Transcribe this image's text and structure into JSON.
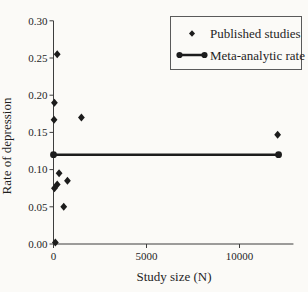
{
  "figure": {
    "background": "#fbfaf7",
    "ink": "#1c1c1c",
    "axis_color": "#3d3d3d"
  },
  "chart_data": {
    "type": "scatter",
    "title": "",
    "xlabel": "Study size (N)",
    "ylabel": "Rate of depression",
    "xlim": [
      0,
      12900
    ],
    "ylim": [
      0,
      0.3
    ],
    "x_ticks": [
      0,
      5000,
      10000
    ],
    "y_ticks": [
      0.0,
      0.05,
      0.1,
      0.15,
      0.2,
      0.25,
      0.3
    ],
    "y_tick_decimals": 2,
    "grid": false,
    "legend_position": "top-right",
    "series": [
      {
        "name": "Published studies",
        "type": "scatter",
        "marker": "diamond",
        "points": [
          [
            200,
            0.255
          ],
          [
            50,
            0.19
          ],
          [
            30,
            0.167
          ],
          [
            1500,
            0.17
          ],
          [
            300,
            0.095
          ],
          [
            750,
            0.085
          ],
          [
            200,
            0.08
          ],
          [
            50,
            0.075
          ],
          [
            550,
            0.05
          ],
          [
            100,
            0.002
          ],
          [
            12050,
            0.147
          ]
        ]
      },
      {
        "name": "Meta-analytic rate",
        "type": "line",
        "marker": "circle",
        "value": 0.12,
        "points": [
          [
            0,
            0.12
          ],
          [
            12100,
            0.12
          ]
        ]
      }
    ]
  }
}
